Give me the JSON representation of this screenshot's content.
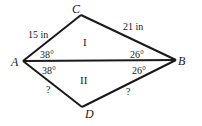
{
  "diagram": {
    "vertices": {
      "A": {
        "label": "A",
        "x": 23,
        "y": 61
      },
      "B": {
        "label": "B",
        "x": 176,
        "y": 60
      },
      "C": {
        "label": "C",
        "x": 81,
        "y": 15
      },
      "D": {
        "label": "D",
        "x": 82,
        "y": 107
      }
    },
    "sides": {
      "AC": "15 in",
      "CB": "21 in",
      "AD": "?",
      "DB": "?"
    },
    "angles": {
      "CAB": "38°",
      "BAD": "38°",
      "CBA": "26°",
      "ABD": "26°"
    },
    "regions": {
      "top": "I",
      "bottom": "II"
    },
    "stroke_color": "#1a1a1a"
  }
}
